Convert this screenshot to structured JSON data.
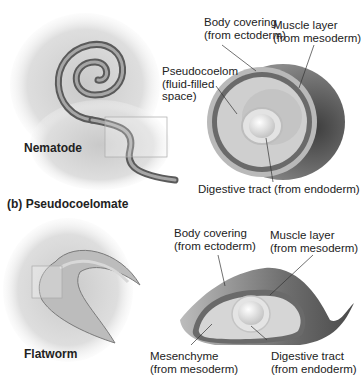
{
  "colors": {
    "background": "#ffffff",
    "body_covering": "#b8b8b8",
    "muscle_layer": "#6a6a6a",
    "cavity": "#d9d9d9",
    "gut": "#e6e6e6",
    "shell_dark": "#555555",
    "text": "#222222"
  },
  "top_panel": {
    "organism_label": "Nematode",
    "labels": {
      "body_covering": "Body covering\n(from ectoderm)",
      "muscle_layer": "Muscle layer\n(from mesoderm)",
      "pseudocoelom": "Pseudocoelom\n(fluid-filled\nspace)",
      "digestive_tract": "Digestive tract (from endoderm)"
    }
  },
  "section_heading": "(b) Pseudocoelomate",
  "bottom_panel": {
    "organism_label": "Flatworm",
    "labels": {
      "body_covering": "Body covering\n(from ectoderm)",
      "muscle_layer": "Muscle layer\n(from mesoderm)",
      "mesenchyme": "Mesenchyme\n(from mesoderm)",
      "digestive_tract": "Digestive tract\n(from endoderm)"
    }
  }
}
